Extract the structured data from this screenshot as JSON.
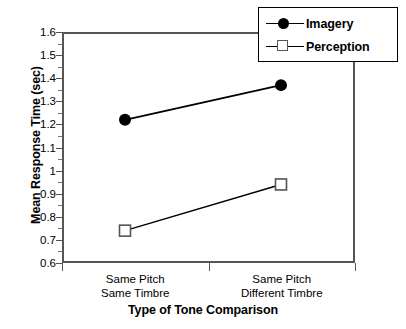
{
  "chart_data": {
    "type": "line",
    "title": "",
    "xlabel": "Type of Tone Comparison",
    "ylabel": "Mean Response Time (sec)",
    "categories": [
      "Same Pitch Same Timbre",
      "Same Pitch Different Timbre"
    ],
    "category_lines": [
      [
        "Same Pitch",
        "Same Timbre"
      ],
      [
        "Same Pitch",
        "Different Timbre"
      ]
    ],
    "series": [
      {
        "name": "Imagery",
        "values": [
          1.22,
          1.37
        ],
        "marker": "filled-circle",
        "color": "#000000"
      },
      {
        "name": "Perception",
        "values": [
          0.74,
          0.94
        ],
        "marker": "open-square",
        "color": "#000000"
      }
    ],
    "ylim": [
      0.6,
      1.6
    ],
    "ytick_step": 0.1,
    "ytick_labels": [
      "1.6",
      "1.5",
      "1.4",
      "1.3",
      "1.2",
      "1.1",
      "1",
      "0.9",
      "0.8",
      "0.7",
      "0.6"
    ],
    "ytick_values": [
      1.6,
      1.5,
      1.4,
      1.3,
      1.2,
      1.1,
      1.0,
      0.9,
      0.8,
      0.7,
      0.6
    ],
    "grid": false,
    "legend_position": "top-right",
    "legend_entries": [
      "Imagery",
      "Perception"
    ]
  }
}
